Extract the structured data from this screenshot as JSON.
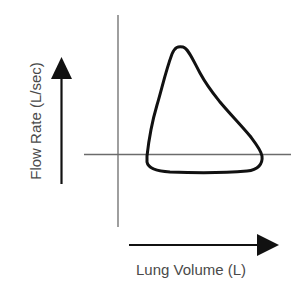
{
  "diagram": {
    "x_axis_label": "Lung Volume (L)",
    "y_axis_label": "Flow Rate (L/sec)",
    "x_arrow_direction": "right",
    "y_arrow_direction": "up",
    "loop_shape": "triangular expiratory limb above axis, flattened inspiratory limb below axis",
    "colors": {
      "loop": "#111111",
      "axes": "#6b6b6b",
      "arrows": "#111111",
      "labels": "#4a4a4a",
      "background": "#ffffff"
    }
  }
}
